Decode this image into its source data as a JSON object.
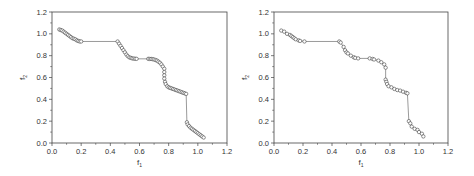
{
  "figure": {
    "panels": [
      "left",
      "right"
    ]
  },
  "chart_data": [
    {
      "type": "scatter",
      "title": "",
      "xlabel": "f1",
      "ylabel": "f2",
      "xlim": [
        0.0,
        1.2
      ],
      "ylim": [
        0.0,
        1.2
      ],
      "xticks": [
        "0.0",
        "0.2",
        "0.4",
        "0.6",
        "0.8",
        "1.0",
        "1.2"
      ],
      "yticks": [
        "0.0",
        "0.2",
        "0.4",
        "0.6",
        "0.8",
        "1.0",
        "1.2"
      ],
      "grid": false,
      "legend": null,
      "marker": "open-circle",
      "connected_line": true,
      "series": [
        {
          "name": "Pareto front",
          "points": [
            [
              0.05,
              1.04
            ],
            [
              0.06,
              1.035
            ],
            [
              0.07,
              1.03
            ],
            [
              0.08,
              1.02
            ],
            [
              0.09,
              1.01
            ],
            [
              0.1,
              1.0
            ],
            [
              0.11,
              0.99
            ],
            [
              0.12,
              0.98
            ],
            [
              0.13,
              0.97
            ],
            [
              0.14,
              0.96
            ],
            [
              0.15,
              0.955
            ],
            [
              0.16,
              0.95
            ],
            [
              0.17,
              0.94
            ],
            [
              0.18,
              0.935
            ],
            [
              0.19,
              0.93
            ],
            [
              0.2,
              0.93
            ],
            [
              0.45,
              0.93
            ],
            [
              0.46,
              0.91
            ],
            [
              0.47,
              0.89
            ],
            [
              0.48,
              0.87
            ],
            [
              0.49,
              0.85
            ],
            [
              0.5,
              0.83
            ],
            [
              0.51,
              0.81
            ],
            [
              0.52,
              0.795
            ],
            [
              0.53,
              0.785
            ],
            [
              0.54,
              0.78
            ],
            [
              0.55,
              0.775
            ],
            [
              0.56,
              0.773
            ],
            [
              0.57,
              0.772
            ],
            [
              0.58,
              0.771
            ],
            [
              0.66,
              0.771
            ],
            [
              0.67,
              0.77
            ],
            [
              0.68,
              0.77
            ],
            [
              0.69,
              0.768
            ],
            [
              0.7,
              0.765
            ],
            [
              0.71,
              0.76
            ],
            [
              0.72,
              0.755
            ],
            [
              0.73,
              0.745
            ],
            [
              0.74,
              0.735
            ],
            [
              0.75,
              0.72
            ],
            [
              0.76,
              0.7
            ],
            [
              0.77,
              0.68
            ],
            [
              0.77,
              0.65
            ],
            [
              0.77,
              0.62
            ],
            [
              0.77,
              0.59
            ],
            [
              0.775,
              0.56
            ],
            [
              0.78,
              0.54
            ],
            [
              0.79,
              0.52
            ],
            [
              0.8,
              0.51
            ],
            [
              0.81,
              0.505
            ],
            [
              0.82,
              0.5
            ],
            [
              0.83,
              0.495
            ],
            [
              0.84,
              0.49
            ],
            [
              0.85,
              0.485
            ],
            [
              0.86,
              0.48
            ],
            [
              0.87,
              0.475
            ],
            [
              0.88,
              0.47
            ],
            [
              0.89,
              0.465
            ],
            [
              0.9,
              0.46
            ],
            [
              0.91,
              0.455
            ],
            [
              0.92,
              0.45
            ],
            [
              0.925,
              0.19
            ],
            [
              0.93,
              0.17
            ],
            [
              0.94,
              0.155
            ],
            [
              0.95,
              0.14
            ],
            [
              0.96,
              0.13
            ],
            [
              0.97,
              0.12
            ],
            [
              0.98,
              0.11
            ],
            [
              0.99,
              0.1
            ],
            [
              1.0,
              0.09
            ],
            [
              1.01,
              0.08
            ],
            [
              1.02,
              0.07
            ],
            [
              1.03,
              0.06
            ],
            [
              1.04,
              0.05
            ]
          ]
        }
      ]
    },
    {
      "type": "scatter",
      "title": "",
      "xlabel": "f1",
      "ylabel": "f2",
      "xlim": [
        0.0,
        1.2
      ],
      "ylim": [
        0.0,
        1.2
      ],
      "xticks": [
        "0.0",
        "0.2",
        "0.4",
        "0.6",
        "0.8",
        "1.0",
        "1.2"
      ],
      "yticks": [
        "0.0",
        "0.2",
        "0.4",
        "0.6",
        "0.8",
        "1.0",
        "1.2"
      ],
      "grid": false,
      "legend": null,
      "marker": "open-circle",
      "connected_line": true,
      "series": [
        {
          "name": "Pareto front",
          "points": [
            [
              0.05,
              1.03
            ],
            [
              0.07,
              1.02
            ],
            [
              0.09,
              1.0
            ],
            [
              0.11,
              0.99
            ],
            [
              0.12,
              0.98
            ],
            [
              0.13,
              0.97
            ],
            [
              0.14,
              0.96
            ],
            [
              0.15,
              0.95
            ],
            [
              0.17,
              0.94
            ],
            [
              0.18,
              0.935
            ],
            [
              0.21,
              0.93
            ],
            [
              0.45,
              0.93
            ],
            [
              0.46,
              0.92
            ],
            [
              0.48,
              0.88
            ],
            [
              0.49,
              0.85
            ],
            [
              0.5,
              0.83
            ],
            [
              0.51,
              0.82
            ],
            [
              0.53,
              0.8
            ],
            [
              0.55,
              0.785
            ],
            [
              0.56,
              0.78
            ],
            [
              0.58,
              0.775
            ],
            [
              0.66,
              0.775
            ],
            [
              0.68,
              0.77
            ],
            [
              0.69,
              0.765
            ],
            [
              0.72,
              0.755
            ],
            [
              0.74,
              0.74
            ],
            [
              0.76,
              0.72
            ],
            [
              0.77,
              0.69
            ],
            [
              0.77,
              0.58
            ],
            [
              0.775,
              0.56
            ],
            [
              0.78,
              0.54
            ],
            [
              0.79,
              0.52
            ],
            [
              0.81,
              0.51
            ],
            [
              0.83,
              0.495
            ],
            [
              0.85,
              0.485
            ],
            [
              0.87,
              0.48
            ],
            [
              0.89,
              0.47
            ],
            [
              0.91,
              0.46
            ],
            [
              0.92,
              0.455
            ],
            [
              0.93,
              0.2
            ],
            [
              0.94,
              0.18
            ],
            [
              0.95,
              0.15
            ],
            [
              0.97,
              0.13
            ],
            [
              0.99,
              0.12
            ],
            [
              1.0,
              0.1
            ],
            [
              1.02,
              0.085
            ],
            [
              1.03,
              0.06
            ]
          ]
        }
      ]
    }
  ]
}
